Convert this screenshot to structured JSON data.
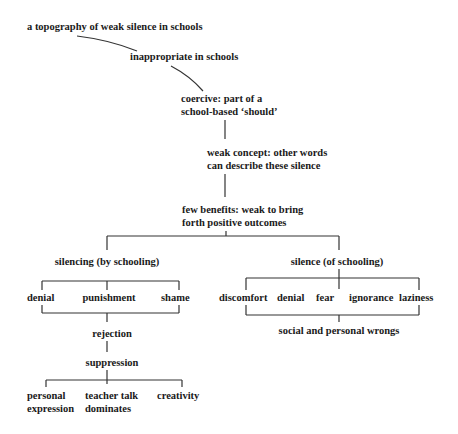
{
  "diagram": {
    "title": "a topography of weak silence in schools",
    "chain": [
      {
        "id": "inappropriate",
        "label": "inappropriate in schools"
      },
      {
        "id": "coercive",
        "line1": "coercive: part of a",
        "line2": "school-based ‘should’"
      },
      {
        "id": "weak-concept",
        "line1": "weak concept: other words",
        "line2": "can describe these silence"
      },
      {
        "id": "few-benefits",
        "line1": "few benefits: weak to bring",
        "line2": "forth positive outcomes"
      }
    ],
    "left_branch": {
      "label": "silencing (by schooling)",
      "children": [
        "denial",
        "punishment",
        "shame"
      ],
      "rejection": "rejection",
      "suppression": "suppression",
      "outcomes": [
        {
          "line1": "personal",
          "line2": "expression"
        },
        {
          "line1": "teacher talk",
          "line2": "dominates"
        },
        {
          "line1": "creativity",
          "line2": ""
        }
      ]
    },
    "right_branch": {
      "label": "silence (of schooling)",
      "children": [
        "discomfort",
        "denial",
        "fear",
        "ignorance",
        "laziness"
      ],
      "result": "social and personal wrongs"
    }
  },
  "colors": {
    "line": "#333333",
    "text": "#1a1a1a",
    "background": "#ffffff"
  }
}
